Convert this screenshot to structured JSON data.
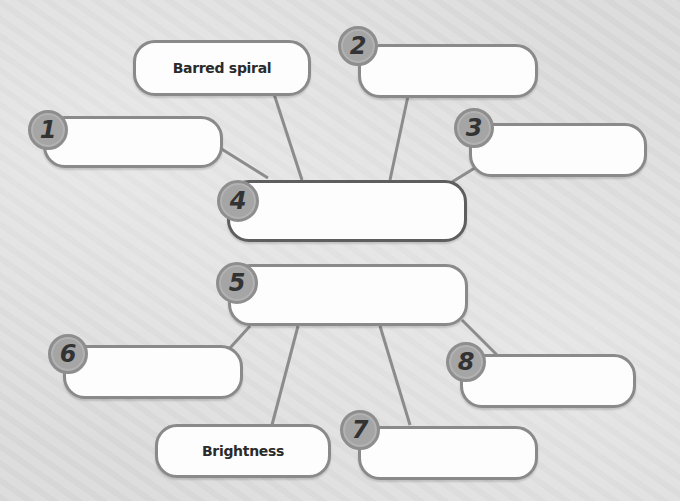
{
  "diagram": {
    "center_boxes": [
      {
        "number": "4",
        "text": ""
      },
      {
        "number": "5",
        "text": ""
      }
    ],
    "boxes": [
      {
        "id": "barred-spiral",
        "number": "",
        "text": "Barred spiral"
      },
      {
        "id": "box-1",
        "number": "1",
        "text": ""
      },
      {
        "id": "box-2",
        "number": "2",
        "text": ""
      },
      {
        "id": "box-3",
        "number": "3",
        "text": ""
      },
      {
        "id": "box-6",
        "number": "6",
        "text": ""
      },
      {
        "id": "brightness",
        "number": "",
        "text": "Brightness"
      },
      {
        "id": "box-7",
        "number": "7",
        "text": ""
      },
      {
        "id": "box-8",
        "number": "8",
        "text": ""
      }
    ],
    "colors": {
      "background": "#dcdcdc",
      "box_fill": "#fdfdfd",
      "box_border": "#8a8a8a",
      "badge_fill": "#a5a5a5",
      "connector": "#8a8a8a"
    }
  }
}
